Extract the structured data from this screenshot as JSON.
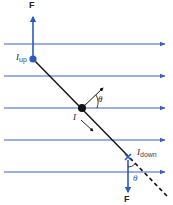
{
  "diagram": {
    "type": "physics-magnetic-force-on-current-loop",
    "colors": {
      "field_line": "#3c5fc8",
      "force_arrow": "#2a5bbf",
      "wire": "#111111",
      "background": "#ffffff"
    },
    "field_lines_y": [
      44,
      76,
      108,
      140,
      172
    ],
    "labels": {
      "force_top": "F",
      "force_bottom": "F",
      "current_up_main": "I",
      "current_up_sub": "up",
      "current_center": "I",
      "current_down_main": "I",
      "current_down_sub": "down",
      "theta_top": "θ",
      "theta_bottom": "θ"
    }
  }
}
